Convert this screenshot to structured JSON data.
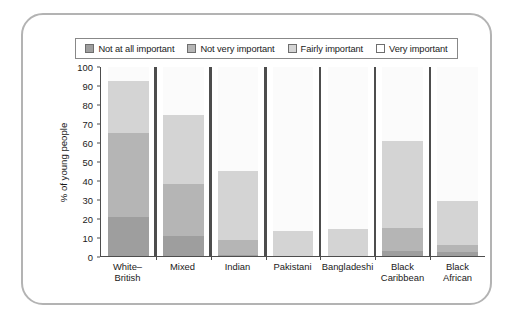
{
  "chart_data": {
    "type": "bar",
    "subtype": "stacked-bar-100",
    "title": "",
    "xlabel": "",
    "ylabel": "% of young people",
    "ylim": [
      0,
      100
    ],
    "ytick_values": [
      0,
      10,
      20,
      30,
      40,
      50,
      60,
      70,
      80,
      90,
      100
    ],
    "ytick_labels": [
      "0",
      "10",
      "20",
      "30",
      "40",
      "50",
      "60",
      "70",
      "80",
      "90",
      "100"
    ],
    "grid": false,
    "legend_position": "top",
    "categories": [
      "White–British",
      "Mixed",
      "Indian",
      "Pakistani",
      "Bangladeshi",
      "Black\nCaribbean",
      "Black\nAfrican"
    ],
    "series": [
      {
        "name": "Not at all important",
        "color": "#9e9e9e",
        "values": [
          20.5,
          10.5,
          0.5,
          0,
          0,
          2.5,
          2
        ]
      },
      {
        "name": "Not very important",
        "color": "#b5b5b5",
        "values": [
          44.5,
          27.5,
          8.0,
          0,
          0,
          12.5,
          4
        ]
      },
      {
        "name": "Fairly important",
        "color": "#d4d4d4",
        "values": [
          27.5,
          36.5,
          36.5,
          13.0,
          14.5,
          46.0,
          23.0
        ]
      },
      {
        "name": "Very important",
        "color": "#fbfbfb",
        "values": [
          7.5,
          25.5,
          55.0,
          87.0,
          85.5,
          39.0,
          71.0
        ]
      }
    ],
    "cumulative_tops": {
      "White–British": {
        "not_at_all_important": 20.5,
        "not_very_important": 65.0,
        "fairly_important": 92.5,
        "very_important": 100
      },
      "Mixed": {
        "not_at_all_important": 10.5,
        "not_very_important": 38.0,
        "fairly_important": 74.5,
        "very_important": 100
      },
      "Indian": {
        "not_at_all_important": 0.5,
        "not_very_important": 8.5,
        "fairly_important": 45.0,
        "very_important": 100
      },
      "Pakistani": {
        "not_at_all_important": 0,
        "not_very_important": 0,
        "fairly_important": 13.0,
        "very_important": 100
      },
      "Bangladeshi": {
        "not_at_all_important": 0,
        "not_very_important": 0,
        "fairly_important": 14.5,
        "very_important": 100
      },
      "Black Caribbean": {
        "not_at_all_important": 2.5,
        "not_very_important": 15.0,
        "fairly_important": 61.0,
        "very_important": 100
      },
      "Black African": {
        "not_at_all_important": 2.0,
        "not_very_important": 6.0,
        "fairly_important": 29.0,
        "very_important": 100
      }
    }
  },
  "legend": {
    "items": [
      {
        "label": "Not at all important",
        "color": "#9e9e9e"
      },
      {
        "label": "Not very important",
        "color": "#b5b5b5"
      },
      {
        "label": "Fairly important",
        "color": "#d4d4d4"
      },
      {
        "label": "Very important",
        "color": "#ffffff"
      }
    ]
  },
  "colors": {
    "frame_border": "#b3b3b3",
    "axis": "#4d4d4d",
    "text": "#1a1a1a",
    "background": "#ffffff"
  }
}
